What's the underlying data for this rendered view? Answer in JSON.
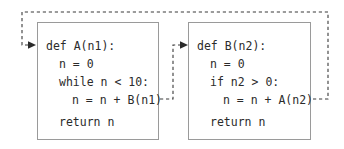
{
  "diagram": {
    "kind": "mutual-recursion-call-flow",
    "colors": {
      "text": "#2b2b2b",
      "box_border": "#9a9a9a",
      "arrow": "#3a3a3a",
      "background": "#ffffff"
    },
    "blocks": [
      {
        "id": "function-a",
        "name": "A",
        "lines": [
          {
            "text": "def A(n1):",
            "indent": 0
          },
          {
            "text": "n = 0",
            "indent": 1
          },
          {
            "text": "while n < 10:",
            "indent": 1
          },
          {
            "text": "n = n + B(n1)",
            "indent": 2
          },
          {
            "text": "return n",
            "indent": 1
          }
        ]
      },
      {
        "id": "function-b",
        "name": "B",
        "lines": [
          {
            "text": "def B(n2):",
            "indent": 0
          },
          {
            "text": "n = 0",
            "indent": 1
          },
          {
            "text": "if n2 > 0:",
            "indent": 1
          },
          {
            "text": "n = n + A(n2)",
            "indent": 2
          },
          {
            "text": "return n",
            "indent": 1
          }
        ]
      }
    ],
    "arrows": [
      {
        "id": "a-calls-b",
        "from": "A line n = n + B(n1)",
        "to": "def B(n2):",
        "style": "dashed"
      },
      {
        "id": "b-calls-a",
        "from": "B line n = n + A(n2)",
        "to": "def A(n1):",
        "style": "dashed"
      }
    ]
  }
}
